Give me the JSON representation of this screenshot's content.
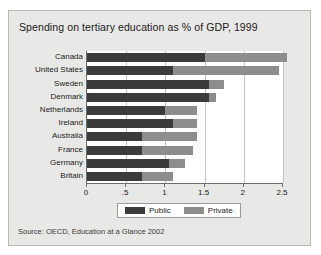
{
  "figure": {
    "title": "Spending on tertiary education as % of GDP, 1999",
    "source": "Source:  OECD, Education at a Glance 2002"
  },
  "legend": {
    "public_label": "Public",
    "private_label": "Private"
  },
  "colors": {
    "public": "#3b3b3b",
    "private": "#8d8d8d",
    "panel_background": "#e8e8e6",
    "plot_background": "#ffffff",
    "gridline": "#c4c4c4",
    "axis": "#6d6d6d"
  },
  "chart_data": {
    "type": "bar",
    "orientation": "horizontal",
    "stacked": true,
    "title": "Spending on tertiary education as % of GDP, 1999",
    "xlabel": "",
    "ylabel": "",
    "xlim": [
      0,
      2.5
    ],
    "grid": true,
    "legend_position": "bottom",
    "xticks": [
      0,
      0.5,
      1,
      1.5,
      2,
      2.5
    ],
    "xtick_labels": [
      "0",
      ".5",
      "1",
      "1.5",
      "2",
      "2.5"
    ],
    "categories": [
      "Canada",
      "United States",
      "Sweden",
      "Denmark",
      "Netherlands",
      "Ireland",
      "Australia",
      "France",
      "Germany",
      "Britain"
    ],
    "series": [
      {
        "name": "Public",
        "values": [
          1.5,
          1.1,
          1.55,
          1.55,
          1.0,
          1.1,
          0.7,
          0.7,
          1.05,
          0.7
        ]
      },
      {
        "name": "Private",
        "values": [
          1.05,
          1.35,
          0.2,
          0.1,
          0.4,
          0.3,
          0.7,
          0.65,
          0.2,
          0.4
        ]
      }
    ],
    "totals": [
      2.55,
      2.45,
      1.75,
      1.65,
      1.4,
      1.4,
      1.4,
      1.35,
      1.25,
      1.1
    ]
  }
}
